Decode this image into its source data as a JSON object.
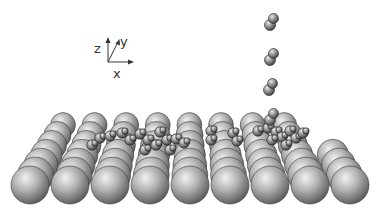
{
  "figure": {
    "axes": {
      "labels": {
        "z": "z",
        "y": "y",
        "x": "x"
      },
      "origin": [
        108,
        62
      ],
      "color": "#333333"
    },
    "surface": {
      "rows": 7,
      "front_columns": 9,
      "front_start_x": 30,
      "front_y": 185,
      "column_spacing": 40,
      "front_radius": 19,
      "row_shift_x": 5,
      "row_shift_y": -10,
      "row_radius_shrink": 1.1,
      "atom_color_light": "#e6e6e6",
      "atom_color_mid": "#a8a8a8",
      "atom_color_dark": "#555555"
    },
    "desorbing_molecules": [
      {
        "x": 272,
        "y": 21
      },
      {
        "x": 272,
        "y": 56
      },
      {
        "x": 271,
        "y": 86
      },
      {
        "x": 272,
        "y": 116
      }
    ],
    "adsorbed_clusters": [
      {
        "x": 92,
        "y": 145
      },
      {
        "x": 100,
        "y": 138
      },
      {
        "x": 110,
        "y": 136
      },
      {
        "x": 122,
        "y": 133
      },
      {
        "x": 130,
        "y": 140
      },
      {
        "x": 140,
        "y": 134
      },
      {
        "x": 148,
        "y": 140
      },
      {
        "x": 156,
        "y": 145
      },
      {
        "x": 160,
        "y": 132
      },
      {
        "x": 167,
        "y": 140
      },
      {
        "x": 176,
        "y": 139
      },
      {
        "x": 184,
        "y": 143
      },
      {
        "x": 145,
        "y": 150
      },
      {
        "x": 170,
        "y": 150
      },
      {
        "x": 211,
        "y": 131
      },
      {
        "x": 233,
        "y": 133
      },
      {
        "x": 237,
        "y": 141
      },
      {
        "x": 211,
        "y": 140
      },
      {
        "x": 258,
        "y": 131
      },
      {
        "x": 268,
        "y": 128
      },
      {
        "x": 276,
        "y": 132
      },
      {
        "x": 282,
        "y": 137
      },
      {
        "x": 290,
        "y": 131
      },
      {
        "x": 296,
        "y": 138
      },
      {
        "x": 286,
        "y": 145
      },
      {
        "x": 272,
        "y": 140
      },
      {
        "x": 303,
        "y": 133
      }
    ]
  }
}
